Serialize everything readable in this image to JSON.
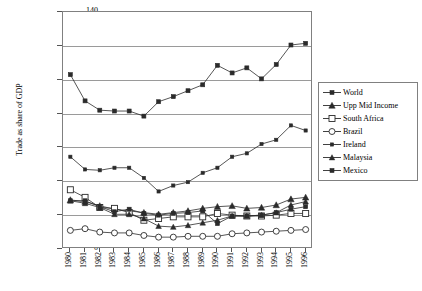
{
  "chart_data": {
    "type": "line",
    "title": "",
    "xlabel": "",
    "ylabel": "Trade as share of GDP",
    "ylim": [
      0,
      140
    ],
    "yticks": [
      0,
      20,
      40,
      60,
      80,
      100,
      120,
      140
    ],
    "grid": true,
    "legend_position": "right",
    "categories": [
      "1980",
      "1981",
      "1982",
      "1983",
      "1984",
      "1985",
      "1986",
      "1987",
      "1988",
      "1989",
      "1990",
      "1991",
      "1992",
      "1993",
      "1994",
      "1995",
      "1996"
    ],
    "series": [
      {
        "name": "World",
        "marker": "filled-square",
        "values": [
          103,
          87.5,
          82,
          81.5,
          81.5,
          78.5,
          87,
          90,
          93.5,
          97,
          108.5,
          104,
          107,
          100.5,
          109,
          120.5,
          121.5
        ]
      },
      {
        "name": "Upp Mid Income",
        "marker": "filled-triangle",
        "values": [
          29,
          28,
          25.5,
          23.5,
          22.5,
          21.5,
          20.5,
          21.5,
          22.5,
          24,
          25,
          25.5,
          24,
          24.5,
          26,
          29.5,
          30.5
        ]
      },
      {
        "name": "South Africa",
        "marker": "open-square",
        "values": [
          35,
          30.5,
          24.5,
          24,
          21.5,
          17,
          18,
          19,
          19,
          19,
          21,
          20,
          19.5,
          19.5,
          20,
          21,
          21
        ]
      },
      {
        "name": "Brazil",
        "marker": "open-circle",
        "values": [
          11,
          12,
          10,
          9.5,
          9.5,
          8,
          7,
          7,
          7.5,
          7.5,
          7.5,
          9,
          9.5,
          10,
          10.5,
          11,
          11.5
        ]
      },
      {
        "name": "Ireland",
        "marker": "filled-square-small",
        "values": [
          54.5,
          47,
          46.5,
          48,
          48,
          42,
          34,
          37.5,
          39.5,
          45,
          48,
          54.5,
          56.5,
          62,
          64.5,
          73,
          70
        ]
      },
      {
        "name": "Malaysia",
        "marker": "filled-triangle-small",
        "values": [
          28.5,
          27,
          24.5,
          20.5,
          20.5,
          18,
          13.5,
          13,
          14,
          15.5,
          17,
          19.5,
          19.5,
          20,
          21.5,
          26,
          28
        ]
      },
      {
        "name": "Mexico",
        "marker": "filled-square-alt",
        "values": [
          28.5,
          28.5,
          25,
          22,
          23.5,
          21,
          20,
          21,
          21.5,
          22.5,
          15,
          19.5,
          19.5,
          20,
          21.5,
          23.5,
          25
        ]
      }
    ]
  }
}
